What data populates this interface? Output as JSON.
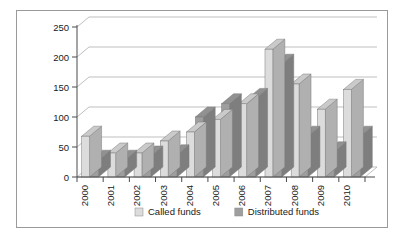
{
  "chart_data": {
    "type": "bar",
    "title": "",
    "subtitle": "",
    "xlabel": "",
    "ylabel": "",
    "categories": [
      "2000",
      "2001",
      "2002",
      "2003",
      "2004",
      "2005",
      "2006",
      "2007",
      "2008",
      "2009",
      "2010"
    ],
    "series": [
      {
        "name": "Called funds",
        "color": "#dcdcdc",
        "values": [
          68,
          40,
          40,
          60,
          75,
          96,
          122,
          213,
          155,
          113,
          146
        ]
      },
      {
        "name": "Distributed funds",
        "color": "#9e9e9e",
        "values": [
          28,
          28,
          35,
          37,
          100,
          122,
          131,
          188,
          68,
          42,
          68
        ]
      }
    ],
    "ylim": [
      0,
      250
    ],
    "yticks": [
      0,
      50,
      100,
      150,
      200,
      250
    ],
    "ytick_labels": [
      "0",
      "50",
      "100",
      "150",
      "200",
      "250"
    ],
    "grid": true,
    "legend_position": "bottom",
    "style": "3d-column",
    "background": "#ffffff",
    "grid_color": "#aeaeae",
    "axis_color": "#4a4a4a",
    "text_color": "#1a1a1a",
    "border_color": "#9a9a9a"
  },
  "legend": {
    "items": [
      {
        "label": "Called funds",
        "color": "#dcdcdc"
      },
      {
        "label": "Distributed funds",
        "color": "#9e9e9e"
      }
    ]
  }
}
